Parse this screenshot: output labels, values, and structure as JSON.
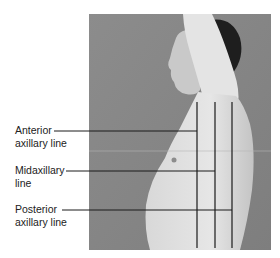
{
  "figure": {
    "colors": {
      "background": "#ffffff",
      "photo_bg": "#8a8a8a",
      "skin": "#dcdcdc",
      "hair": "#1e1e1e",
      "line": "#1a1a1a",
      "text": "#222222"
    },
    "labels": [
      {
        "id": "anterior",
        "line1": "Anterior",
        "line2": "axillary line"
      },
      {
        "id": "mid",
        "line1": "Midaxillary",
        "line2": "line"
      },
      {
        "id": "posterior",
        "line1": "Posterior",
        "line2": "axillary line"
      }
    ]
  }
}
